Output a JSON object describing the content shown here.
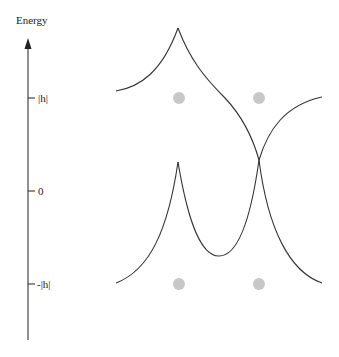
{
  "axis": {
    "title": "Energy",
    "ticks": [
      {
        "label": "|h|",
        "y": 98
      },
      {
        "label": "0",
        "y": 191
      },
      {
        "label": "-|h|",
        "y": 284
      }
    ]
  },
  "colors": {
    "curve": "#333333",
    "dot": "#c8c8c8",
    "axis": "#333333"
  },
  "dots": [
    {
      "x": 179,
      "y": 98
    },
    {
      "x": 259,
      "y": 98
    },
    {
      "x": 179,
      "y": 284
    },
    {
      "x": 259,
      "y": 284
    }
  ],
  "curves": {
    "upper_left_peak": {
      "peak": [
        178,
        28
      ]
    },
    "crossing": {
      "point": [
        259,
        160
      ]
    },
    "lower_left_peak": {
      "peak": [
        178,
        162
      ]
    },
    "valley": {
      "bottom": [
        219,
        256
      ]
    }
  }
}
